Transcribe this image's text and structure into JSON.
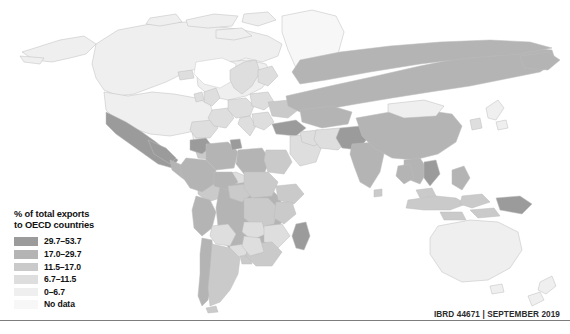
{
  "legend": {
    "title": "% of total exports\nto OECD countries",
    "rows": [
      {
        "label": "29.7–53.7",
        "color": "#9b9b9b"
      },
      {
        "label": "17.0–29.7",
        "color": "#b4b4b4"
      },
      {
        "label": "11.5–17.0",
        "color": "#cacaca"
      },
      {
        "label": "6.7–11.5",
        "color": "#dedede"
      },
      {
        "label": "0–6.7",
        "color": "#efefef"
      },
      {
        "label": "No data",
        "color": "#f7f7f7"
      }
    ]
  },
  "footer": {
    "credit": "IBRD 44671  |  SEPTEMBER 2019"
  },
  "chart_data": {
    "type": "map",
    "title": "% of total exports to OECD countries",
    "projection": "world-equirectangular",
    "value_unit": "percent of total exports",
    "background": "#ffffff",
    "border_color": "#bdbdbd",
    "classes": [
      {
        "label": "29.7–53.7",
        "min": 29.7,
        "max": 53.7,
        "color": "#9b9b9b"
      },
      {
        "label": "17.0–29.7",
        "min": 17.0,
        "max": 29.7,
        "color": "#b4b4b4"
      },
      {
        "label": "11.5–17.0",
        "min": 11.5,
        "max": 17.0,
        "color": "#cacaca"
      },
      {
        "label": "6.7–11.5",
        "min": 6.7,
        "max": 11.5,
        "color": "#dedede"
      },
      {
        "label": "0–6.7",
        "min": 0.0,
        "max": 6.7,
        "color": "#efefef"
      },
      {
        "label": "No data",
        "min": null,
        "max": null,
        "color": "#f7f7f7"
      }
    ],
    "regions": [
      {
        "name": "Canada",
        "class": "0–6.7"
      },
      {
        "name": "United States",
        "class": "0–6.7"
      },
      {
        "name": "Greenland",
        "class": "No data"
      },
      {
        "name": "Mexico",
        "class": "29.7–53.7"
      },
      {
        "name": "Central America",
        "class": "17.0–29.7"
      },
      {
        "name": "Caribbean",
        "class": "11.5–17.0"
      },
      {
        "name": "Colombia",
        "class": "11.5–17.0"
      },
      {
        "name": "Venezuela",
        "class": "6.7–11.5"
      },
      {
        "name": "Peru",
        "class": "17.0–29.7"
      },
      {
        "name": "Brazil",
        "class": "17.0–29.7"
      },
      {
        "name": "Bolivia",
        "class": "6.7–11.5"
      },
      {
        "name": "Paraguay",
        "class": "6.7–11.5"
      },
      {
        "name": "Argentina",
        "class": "11.5–17.0"
      },
      {
        "name": "Chile",
        "class": "17.0–29.7"
      },
      {
        "name": "Morocco",
        "class": "29.7–53.7"
      },
      {
        "name": "Algeria",
        "class": "17.0–29.7"
      },
      {
        "name": "Tunisia",
        "class": "29.7–53.7"
      },
      {
        "name": "Libya",
        "class": "17.0–29.7"
      },
      {
        "name": "Egypt",
        "class": "11.5–17.0"
      },
      {
        "name": "West Africa",
        "class": "17.0–29.7"
      },
      {
        "name": "Nigeria",
        "class": "11.5–17.0"
      },
      {
        "name": "Central Africa",
        "class": "11.5–17.0"
      },
      {
        "name": "Ethiopia",
        "class": "11.5–17.0"
      },
      {
        "name": "Kenya",
        "class": "11.5–17.0"
      },
      {
        "name": "Angola",
        "class": "6.7–11.5"
      },
      {
        "name": "Zambia",
        "class": "6.7–11.5"
      },
      {
        "name": "South Africa",
        "class": "11.5–17.0"
      },
      {
        "name": "Madagascar",
        "class": "29.7–53.7"
      },
      {
        "name": "Europe",
        "class": "6.7–11.5"
      },
      {
        "name": "Turkey",
        "class": "29.7–53.7"
      },
      {
        "name": "Russia",
        "class": "17.0–29.7"
      },
      {
        "name": "Kazakhstan",
        "class": "17.0–29.7"
      },
      {
        "name": "Saudi Arabia",
        "class": "6.7–11.5"
      },
      {
        "name": "Iran",
        "class": "6.7–11.5"
      },
      {
        "name": "Pakistan",
        "class": "29.7–53.7"
      },
      {
        "name": "India",
        "class": "17.0–29.7"
      },
      {
        "name": "China",
        "class": "17.0–29.7"
      },
      {
        "name": "Mongolia",
        "class": "0–6.7"
      },
      {
        "name": "Japan",
        "class": "0–6.7"
      },
      {
        "name": "Korea",
        "class": "6.7–11.5"
      },
      {
        "name": "Vietnam",
        "class": "29.7–53.7"
      },
      {
        "name": "Thailand",
        "class": "17.0–29.7"
      },
      {
        "name": "Philippines",
        "class": "17.0–29.7"
      },
      {
        "name": "Indonesia",
        "class": "11.5–17.0"
      },
      {
        "name": "Papua New Guinea",
        "class": "29.7–53.7"
      },
      {
        "name": "Australia",
        "class": "0–6.7"
      },
      {
        "name": "New Zealand",
        "class": "0–6.7"
      }
    ]
  }
}
